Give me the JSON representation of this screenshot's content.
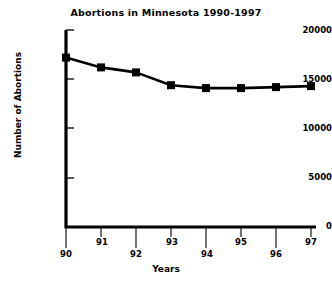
{
  "chart_data": {
    "type": "line",
    "title": "Abortions in Minnesota 1990-1997",
    "xlabel": "Years",
    "ylabel": "Number of Abortions",
    "categories": [
      "90",
      "91",
      "92",
      "93",
      "94",
      "95",
      "96",
      "97"
    ],
    "values": [
      17200,
      16200,
      15700,
      14400,
      14100,
      14100,
      14200,
      14300
    ],
    "series": [
      {
        "name": "Number of Abortions",
        "values": [
          17200,
          16200,
          15700,
          14400,
          14100,
          14100,
          14200,
          14300
        ]
      }
    ],
    "ylim": [
      0,
      20000
    ],
    "yticks": [
      0,
      5000,
      10000,
      15000,
      20000
    ],
    "ytick_labels": [
      "0",
      "5000",
      "10000",
      "15000",
      "20000"
    ],
    "xticks": [
      "90",
      "91",
      "92",
      "93",
      "94",
      "95",
      "96",
      "97"
    ],
    "grid": false,
    "legend": false,
    "marker": "square",
    "line_color": "#000000",
    "marker_color": "#000000",
    "background_color": "#ffffff",
    "axis_color": "#000000"
  }
}
